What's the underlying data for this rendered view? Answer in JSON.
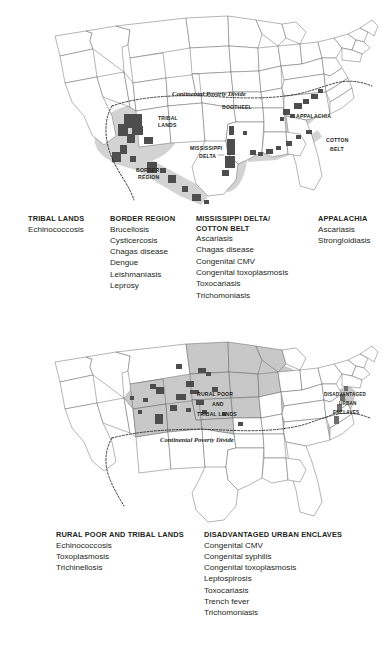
{
  "figure": {
    "panels": [
      {
        "id": "top",
        "map": {
          "labels": {
            "divide": "Continental Poverty Divide",
            "tribal_lands": "TRIBAL\nLANDS",
            "border_region": "BORDER\nREGION",
            "bootheel": "BOOTHEEL",
            "mississippi_delta": "MISSISSIPPI\nDELTA",
            "appalachia": "APPALACHIA",
            "cotton_belt": "COTTON\nBELT"
          }
        },
        "legend": [
          {
            "title": "TRIBAL LANDS",
            "items": [
              "Echinococcosis"
            ]
          },
          {
            "title": "BORDER REGION",
            "items": [
              "Brucellosis",
              "Cysticercosis",
              "Chagas disease",
              "Dengue",
              "Leishmaniasis",
              "Leprosy"
            ]
          },
          {
            "title": "MISSISSIPPI DELTA/\nCOTTON BELT",
            "items": [
              "Ascariasis",
              "Chagas disease",
              "Congenital CMV",
              "Congenital toxoplasmosis",
              "Toxocariasis",
              "Trichomoniasis"
            ]
          },
          {
            "title": "APPALACHIA",
            "items": [
              "Ascariasis",
              "Strongloidiasis"
            ]
          }
        ]
      },
      {
        "id": "bottom",
        "map": {
          "labels": {
            "divide": "Continental Poverty Divide",
            "rural_poor": "RURAL POOR\nAND\nTRIBAL LANDS",
            "urban_enclaves": "DISADVANTAGED\nURBAN\nENCLAVES"
          }
        },
        "legend": [
          {
            "title": "RURAL POOR AND TRIBAL LANDS",
            "items": [
              "Echinococcosis",
              "Toxoplasmosis",
              "Trichinellosis"
            ]
          },
          {
            "title": "DISADVANTAGED URBAN ENCLAVES",
            "items": [
              "Congenital CMV",
              "Congenital syphilis",
              "Congenital toxoplasmosis",
              "Leptospirosis",
              "Toxocariasis",
              "Trench fever",
              "Trichomoniasis"
            ]
          }
        ]
      }
    ]
  },
  "colors": {
    "state_outline": "#58595b",
    "state_fill": "#ffffff",
    "shaded_region": "#c8c8c8",
    "county_dark": "#4d4d4d",
    "text": "#231f20",
    "background": "#ffffff"
  }
}
